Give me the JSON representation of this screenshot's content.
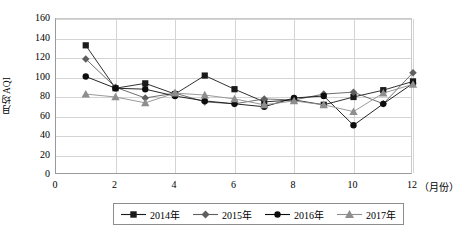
{
  "chart_data": {
    "type": "line",
    "title": "",
    "xlabel": "（月份）",
    "ylabel": "月均AQI",
    "x": [
      1,
      2,
      3,
      4,
      5,
      6,
      7,
      8,
      9,
      10,
      11,
      12
    ],
    "xlim": [
      0,
      12
    ],
    "ylim": [
      0,
      160
    ],
    "xticks": [
      "0",
      "2",
      "4",
      "6",
      "8",
      "10",
      "12"
    ],
    "xtick_values": [
      0,
      2,
      4,
      6,
      8,
      10,
      12
    ],
    "yticks": [
      "0",
      "20",
      "40",
      "60",
      "80",
      "100",
      "120",
      "140",
      "160"
    ],
    "ytick_values": [
      0,
      20,
      40,
      60,
      80,
      100,
      120,
      140,
      160
    ],
    "grid": "horizontal-and-vertical",
    "legend_position": "bottom",
    "series": [
      {
        "name": "2014年",
        "marker": "square",
        "color": "#1a1a1a",
        "values": [
          133,
          89,
          94,
          83,
          102,
          88,
          75,
          77,
          72,
          80,
          87,
          96
        ]
      },
      {
        "name": "2015年",
        "marker": "diamond",
        "color": "#5f5f5f",
        "values": [
          119,
          90,
          79,
          84,
          75,
          73,
          78,
          77,
          83,
          85,
          73,
          105
        ]
      },
      {
        "name": "2016年",
        "marker": "circle",
        "color": "#0d0d0d",
        "values": [
          101,
          89,
          88,
          81,
          76,
          73,
          70,
          79,
          81,
          51,
          73,
          94
        ]
      },
      {
        "name": "2017年",
        "marker": "triangle",
        "color": "#8e8e8e",
        "values": [
          83,
          80,
          74,
          84,
          82,
          78,
          72,
          76,
          72,
          65,
          84,
          93
        ]
      }
    ]
  },
  "axis": {
    "y_title": "月均AQI",
    "x_unit": "（月份）"
  }
}
